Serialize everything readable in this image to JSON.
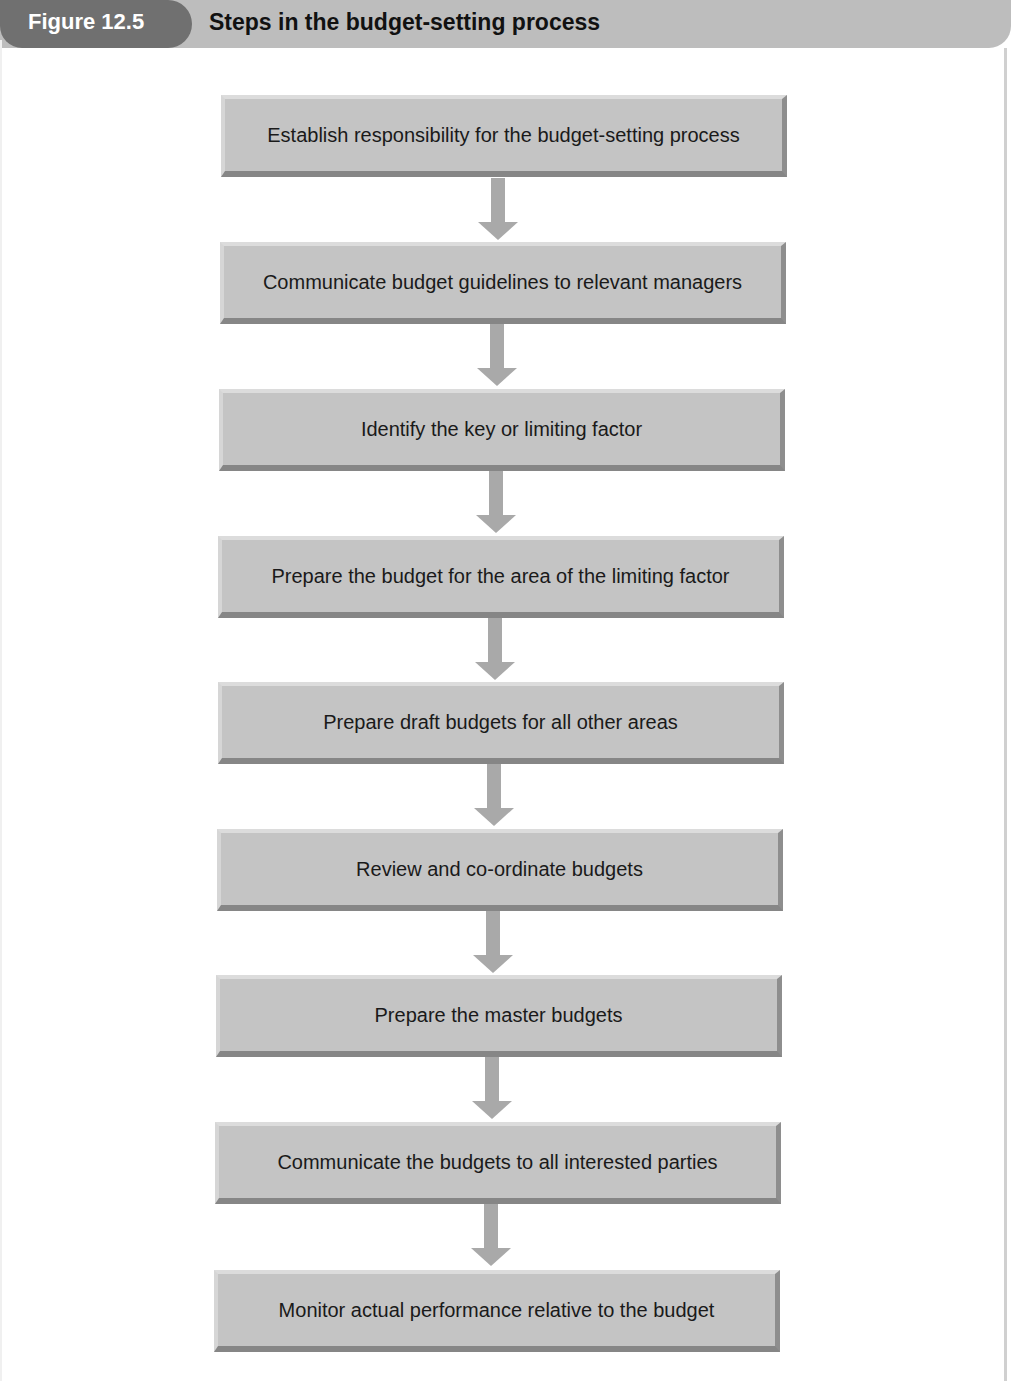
{
  "header": {
    "figure_label": "Figure 12.5",
    "title": "Steps in the budget-setting process"
  },
  "colors": {
    "header_bar": "#bdbdbd",
    "badge": "#707070",
    "box_fill": "#c4c4c4",
    "arrow": "#a9a9a9"
  },
  "steps": [
    {
      "label": "Establish responsibility for the budget-setting process"
    },
    {
      "label": "Communicate budget guidelines to relevant managers"
    },
    {
      "label": "Identify the key or limiting factor"
    },
    {
      "label": "Prepare the budget for the area of the limiting factor"
    },
    {
      "label": "Prepare draft budgets for all other areas"
    },
    {
      "label": "Review and co-ordinate budgets"
    },
    {
      "label": "Prepare the master budgets"
    },
    {
      "label": "Communicate the budgets to all interested parties"
    },
    {
      "label": "Monitor actual performance relative to the budget"
    }
  ]
}
